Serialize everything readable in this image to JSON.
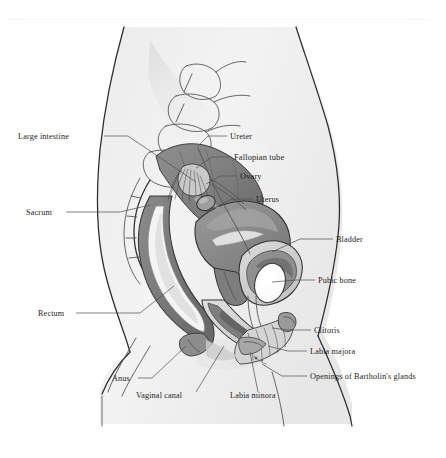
{
  "figure": {
    "view": "mid-sagittal cross-section of the female pelvis",
    "style": "grayscale medical illustration, serif labels with leader lines",
    "width": 446,
    "height": 458
  },
  "palette": {
    "page_background": "#ffffff",
    "body_fill": "#f1f1f1",
    "body_fill_shadow": "#e3e3e3",
    "soft_tissue": "#d8d8d8",
    "organ_mid_gray": "#8d8d8d",
    "organ_dark_gray": "#6e6e6e",
    "organ_darkest": "#5a5a5a",
    "lumen_light": "#f7f7f7",
    "bone_white": "#fdfdfd",
    "outline_stroke": "#2b2b2b",
    "leader_stroke": "#4e4e4e",
    "label_text": "#1d1d1d"
  },
  "labels": [
    {
      "id": "large-intestine",
      "text": "Large intestine",
      "side": "left",
      "text_x": 18,
      "text_y": 139,
      "anchor": "start",
      "leader": "M104,136 L128,136 L196,182"
    },
    {
      "id": "sacrum",
      "text": "Sacrum",
      "side": "left",
      "text_x": 26,
      "text_y": 215,
      "anchor": "start",
      "leader": "M66,212 L120,212 L150,205"
    },
    {
      "id": "rectum",
      "text": "Rectum",
      "side": "left",
      "text_x": 38,
      "text_y": 316,
      "anchor": "start",
      "leader": "M76,313 L140,313 L174,286"
    },
    {
      "id": "anus",
      "text": "Anus",
      "side": "bottom",
      "text_x": 112,
      "text_y": 381,
      "anchor": "start",
      "leader": "M138,378 L152,378 L186,346"
    },
    {
      "id": "vaginal-canal",
      "text": "Vaginal canal",
      "side": "bottom",
      "text_x": 136,
      "text_y": 398,
      "anchor": "start",
      "leader": "M196,392 L224,346"
    },
    {
      "id": "labia-minora",
      "text": "Labia minora",
      "side": "bottom",
      "text_x": 230,
      "text_y": 398,
      "anchor": "start",
      "leader": "M258,392 L250,352"
    },
    {
      "id": "ureter",
      "text": "Ureter",
      "side": "right",
      "text_x": 230,
      "text_y": 139,
      "anchor": "start",
      "leader": "M227,136 L208,136 L198,146"
    },
    {
      "id": "fallopian-tube",
      "text": "Fallopian tube",
      "side": "right",
      "text_x": 234,
      "text_y": 160,
      "anchor": "start",
      "leader": "M231,157 L212,157 L196,168"
    },
    {
      "id": "ovary",
      "text": "Ovary",
      "side": "right",
      "text_x": 240,
      "text_y": 179,
      "anchor": "start",
      "leader": "M237,176 L220,176 L206,184"
    },
    {
      "id": "uterus",
      "text": "Uterus",
      "side": "right",
      "text_x": 256,
      "text_y": 202,
      "anchor": "start",
      "leader": "M253,199 L232,199 L206,212"
    },
    {
      "id": "bladder",
      "text": "Bladder",
      "side": "right",
      "text_x": 336,
      "text_y": 242,
      "anchor": "start",
      "leader": "M333,239 L300,239 L272,252"
    },
    {
      "id": "pubic-bone",
      "text": "Pubic bone",
      "side": "right",
      "text_x": 318,
      "text_y": 283,
      "anchor": "start",
      "leader": "M315,280 L296,280 L272,282"
    },
    {
      "id": "clitoris",
      "text": "Clitoris",
      "side": "right",
      "text_x": 314,
      "text_y": 333,
      "anchor": "start",
      "leader": "M311,330 L288,330 L272,328"
    },
    {
      "id": "labia-majora",
      "text": "Labia majora",
      "side": "right",
      "text_x": 310,
      "text_y": 354,
      "anchor": "start",
      "leader": "M307,351 L288,351 L268,346"
    },
    {
      "id": "bartholin-glands",
      "text": "Openings of Bartholin's glands",
      "side": "right",
      "text_x": 310,
      "text_y": 379,
      "anchor": "start",
      "leader": "M307,376 L282,376 L262,364"
    }
  ],
  "structures": [
    {
      "id": "body-silhouette",
      "name": "Body silhouette (abdomen, pelvis, thigh)"
    },
    {
      "id": "spine-vertebrae",
      "name": "Lumbar vertebrae and sacrum"
    },
    {
      "id": "large-intestine",
      "name": "Large intestine (descending colon)"
    },
    {
      "id": "uterus",
      "name": "Uterus"
    },
    {
      "id": "fallopian-tube",
      "name": "Fallopian tube with fimbriae"
    },
    {
      "id": "ovary",
      "name": "Ovary"
    },
    {
      "id": "bladder",
      "name": "Urinary bladder"
    },
    {
      "id": "pubic-bone",
      "name": "Pubic bone (symphysis, cross-section)"
    },
    {
      "id": "rectum",
      "name": "Rectum"
    },
    {
      "id": "anal-canal",
      "name": "Anal canal and anus"
    },
    {
      "id": "vaginal-canal",
      "name": "Vaginal canal"
    },
    {
      "id": "vulva",
      "name": "Labia majora, labia minora, clitoris"
    }
  ]
}
